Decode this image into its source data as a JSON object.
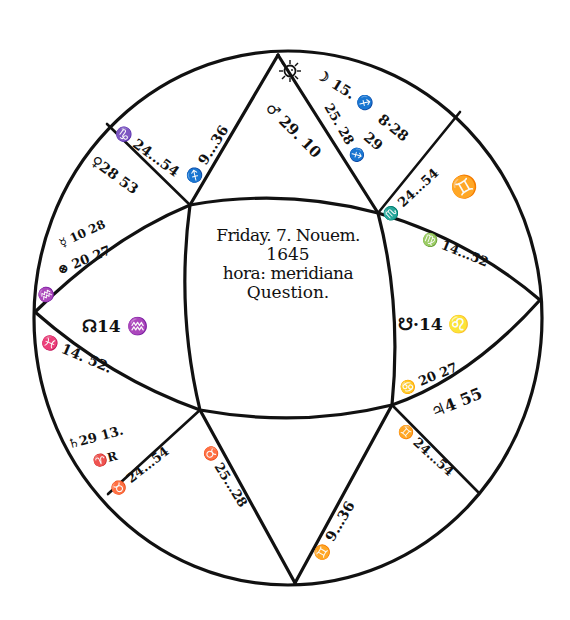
{
  "chart_title": "Horary Question Chart",
  "center_text": {
    "line1": "Friday. 7. Nouem.",
    "line2": "1645",
    "line3": "hora: meridiana",
    "line4": "Question."
  },
  "houses": {
    "ascendant": {
      "label": "☊14♒",
      "cusp": "♓ 14. 52."
    },
    "descendant": {
      "label": "☋·14 ♌",
      "cusp": "♍ 14. 52."
    },
    "midheaven_upper_left": "♐ 9. 36",
    "midheaven_upper_right": "♐ 28",
    "ic_lower_left": "♉ 28",
    "ic_lower_right": "♊ 9. 36",
    "cusp_11": "♑ 24. 54",
    "cusp_12": "♒ 20 27",
    "cusp_9": "♏ 24. 54",
    "cusp_5": "♊ 24. 54",
    "cusp_3": "♈ 24. 54",
    "cusp_6": "♋ 20 27"
  },
  "planets": {
    "sun": "☉",
    "moon": "☽ 15. ♐",
    "mars": "♂ 29. 10",
    "mercury_ul": "♀ 28 53",
    "mercury_sym": "☿ 10 28",
    "fortune": "⊗ 20 27",
    "saturn": "♄ 29 13. ♈ R",
    "jupiter": "♃ 4 55",
    "venus_28": "8·28",
    "venus_29": "29",
    "gemini_sign": "♊",
    "cancer_69": "♋"
  },
  "labels": [
    {
      "id": "mc-ul",
      "text": "♐ 9.‥36",
      "x": 190,
      "y": 175,
      "rot": -58,
      "size": 14
    },
    {
      "id": "cusp11",
      "text": "♑ 24.‥54",
      "x": 117,
      "y": 122,
      "rot": 36,
      "size": 14
    },
    {
      "id": "venus",
      "text": "♀28 53",
      "x": 93,
      "y": 152,
      "rot": 36,
      "size": 14
    },
    {
      "id": "mercury",
      "text": "☿ 10 28",
      "x": 60,
      "y": 238,
      "rot": -25,
      "size": 12
    },
    {
      "id": "fortune",
      "text": "⊗ 20 27",
      "x": 58,
      "y": 264,
      "rot": -22,
      "size": 13
    },
    {
      "id": "cusp12",
      "text": "♒",
      "x": 38,
      "y": 292,
      "rot": -30,
      "size": 14
    },
    {
      "id": "node-n",
      "text": "☊14 ♒",
      "x": 82,
      "y": 318,
      "rot": 0,
      "size": 17
    },
    {
      "id": "asc-cusp",
      "text": "♓ 14. 52.",
      "x": 42,
      "y": 332,
      "rot": 23,
      "size": 14
    },
    {
      "id": "saturn",
      "text": "♄29 13.",
      "x": 68,
      "y": 438,
      "rot": -15,
      "size": 13
    },
    {
      "id": "saturn-r",
      "text": "♈R",
      "x": 93,
      "y": 456,
      "rot": -15,
      "size": 12
    },
    {
      "id": "cusp3",
      "text": "♉ 24.‥54",
      "x": 112,
      "y": 486,
      "rot": -38,
      "size": 13
    },
    {
      "id": "ic-ll",
      "text": "♉ 25.‥28",
      "x": 207,
      "y": 440,
      "rot": 58,
      "size": 13
    },
    {
      "id": "ic-lr",
      "text": "♊ 9.‥36",
      "x": 318,
      "y": 552,
      "rot": -60,
      "size": 14
    },
    {
      "id": "cusp5",
      "text": "♊ 24.‥54",
      "x": 400,
      "y": 420,
      "rot": 42,
      "size": 13
    },
    {
      "id": "jupiter",
      "text": "♃4 55",
      "x": 432,
      "y": 405,
      "rot": -22,
      "size": 16
    },
    {
      "id": "cusp6",
      "text": "♋ 20 27",
      "x": 400,
      "y": 383,
      "rot": -22,
      "size": 13
    },
    {
      "id": "node-s",
      "text": "☋·14 ♌",
      "x": 398,
      "y": 316,
      "rot": 0,
      "size": 17
    },
    {
      "id": "desc-cusp",
      "text": "♍ 14.‥52",
      "x": 423,
      "y": 230,
      "rot": 22,
      "size": 13
    },
    {
      "id": "gemini",
      "text": "♊",
      "x": 452,
      "y": 182,
      "rot": -30,
      "size": 22
    },
    {
      "id": "cusp9",
      "text": "♏ 24.‥54",
      "x": 385,
      "y": 212,
      "rot": -43,
      "size": 13
    },
    {
      "id": "mc-ur",
      "text": "25. 28 ♐",
      "x": 328,
      "y": 98,
      "rot": 60,
      "size": 13
    },
    {
      "id": "moon",
      "text": "☽ 15. ♐",
      "x": 318,
      "y": 66,
      "rot": 32,
      "size": 14
    },
    {
      "id": "v828",
      "text": "8·28",
      "x": 380,
      "y": 110,
      "rot": 38,
      "size": 14
    },
    {
      "id": "v29",
      "text": "29",
      "x": 366,
      "y": 128,
      "rot": 40,
      "size": 14
    },
    {
      "id": "mars",
      "text": "♂ 29. 10",
      "x": 268,
      "y": 98,
      "rot": 45,
      "size": 15
    }
  ],
  "geometry": {
    "ellipse": {
      "cx": 288,
      "cy": 318,
      "rx": 254,
      "ry": 267
    },
    "top": [
      278,
      55
    ],
    "bottom": [
      295,
      583
    ],
    "left": [
      35,
      312
    ],
    "right": [
      540,
      300
    ],
    "inner_tl": [
      190,
      205
    ],
    "inner_tr": [
      378,
      213
    ],
    "inner_bl": [
      200,
      410
    ],
    "inner_br": [
      392,
      405
    ]
  }
}
